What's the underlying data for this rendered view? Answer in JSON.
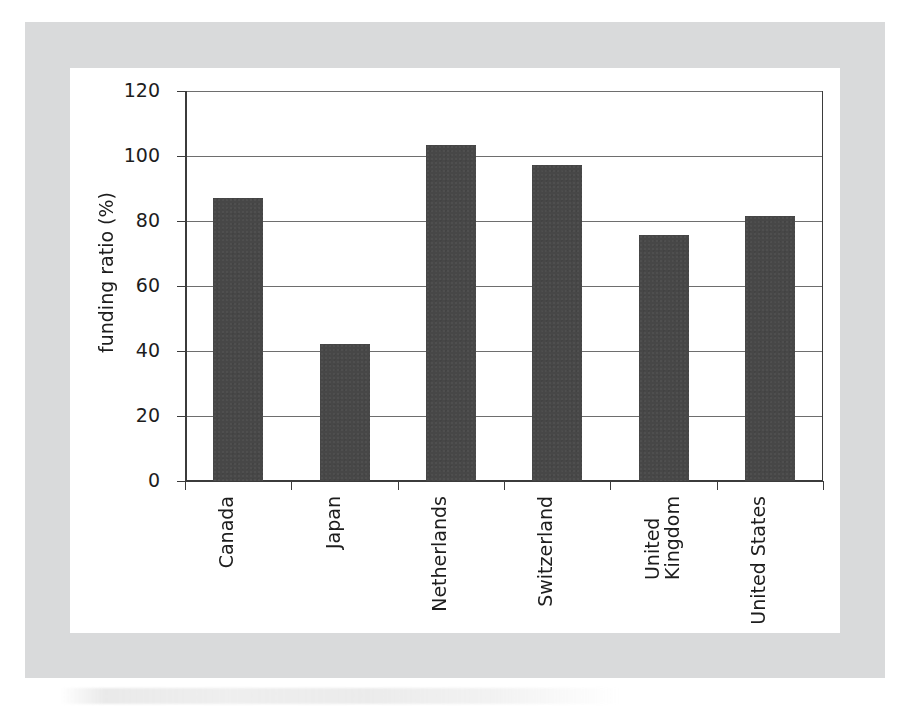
{
  "figure": {
    "frame_color": "#d9dadb",
    "card_color": "#ffffff"
  },
  "chart_data": {
    "type": "bar",
    "title": "",
    "subtitle": "",
    "xlabel": "",
    "ylabel": "funding ratio (%)",
    "categories": [
      "Canada",
      "Japan",
      "Netherlands",
      "Switzerland",
      "United\nKingdom",
      "United States"
    ],
    "values": [
      87,
      42.3,
      103.4,
      97.2,
      75.8,
      81.5
    ],
    "ylim": [
      0,
      120
    ],
    "yticks": [
      0,
      20,
      40,
      60,
      80,
      100,
      120
    ],
    "ytick_labels": [
      "0",
      "20",
      "40",
      "60",
      "80",
      "100",
      "120"
    ],
    "grid": "horizontal",
    "legend": "none",
    "bar_color": "#474747",
    "axis_color": "#3b3b3b",
    "gridline_color": "#6e6e6e",
    "xtick_rotation": 90
  }
}
